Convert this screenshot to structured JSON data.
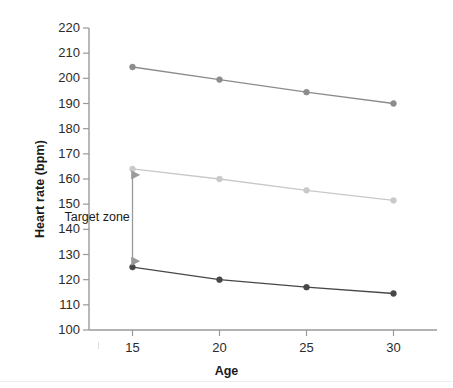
{
  "chart_data": {
    "type": "line",
    "title": "",
    "xlabel": "Age",
    "ylabel": "Heart rate (bpm)",
    "x": [
      15,
      20,
      25,
      30
    ],
    "xtick_labels": [
      "15",
      "20",
      "25",
      "30"
    ],
    "xlim": [
      12.5,
      32.5
    ],
    "ylim": [
      100,
      220
    ],
    "ytick_labels": [
      "220",
      "210",
      "200",
      "190",
      "180",
      "170",
      "160",
      "150",
      "140",
      "130",
      "120",
      "110",
      "100"
    ],
    "yticks": [
      220,
      210,
      200,
      190,
      180,
      170,
      160,
      150,
      140,
      130,
      120,
      110,
      100
    ],
    "grid": false,
    "legend": "none",
    "series": [
      {
        "name": "Maximum heart rate",
        "color": "#8c8c8c",
        "marker": "circle",
        "values": [
          204.5,
          199.5,
          194.5,
          190.0
        ]
      },
      {
        "name": "Target zone upper limit",
        "color": "#c9c9c9",
        "marker": "circle",
        "values": [
          164.0,
          160.0,
          155.5,
          151.5
        ]
      },
      {
        "name": "Target zone lower limit",
        "color": "#474747",
        "marker": "circle",
        "values": [
          125.0,
          120.0,
          117.0,
          114.5
        ]
      }
    ],
    "annotations": [
      {
        "type": "double-arrow",
        "label": "Target zone",
        "x": 15,
        "y_top": 164.0,
        "y_bottom": 125.0,
        "color": "#9a9a9a"
      }
    ]
  },
  "axis": {
    "y_title": "Heart rate (bpm)",
    "x_title": "Age",
    "axis_color": "#9a9a9a"
  },
  "annotation": {
    "target_zone_label": "Target zone"
  }
}
